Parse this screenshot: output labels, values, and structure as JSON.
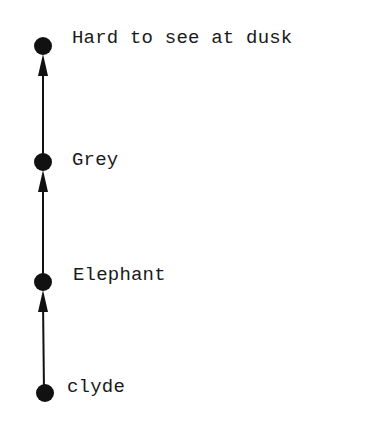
{
  "diagram": {
    "type": "chain",
    "direction": "bottom-to-top",
    "colors": {
      "background": "#ffffff",
      "ink": "#111111"
    },
    "nodes": [
      {
        "id": "n4",
        "label": "Hard to see at dusk",
        "cx": 43,
        "cy": 46,
        "label_x": 72,
        "label_top": 29
      },
      {
        "id": "n3",
        "label": "Grey",
        "cx": 43,
        "cy": 162,
        "label_x": 72,
        "label_top": 151
      },
      {
        "id": "n2",
        "label": "Elephant",
        "cx": 43,
        "cy": 282,
        "label_x": 73,
        "label_top": 266
      },
      {
        "id": "n1",
        "label": "clyde",
        "cx": 45,
        "cy": 393,
        "label_x": 67,
        "label_top": 378
      }
    ],
    "edges": [
      {
        "from": "clyde",
        "to": "Elephant"
      },
      {
        "from": "Elephant",
        "to": "Grey"
      },
      {
        "from": "Grey",
        "to": "Hard to see at dusk"
      }
    ]
  }
}
